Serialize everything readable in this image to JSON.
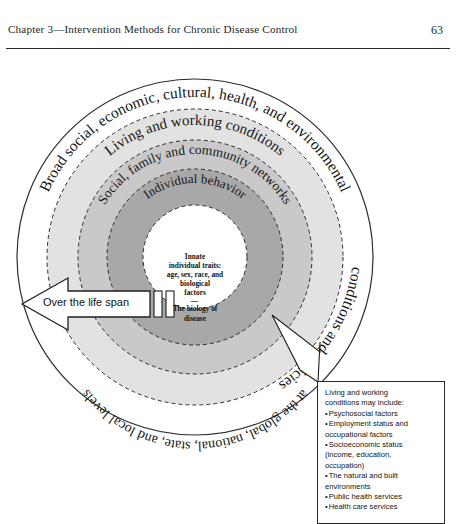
{
  "header": {
    "title": "Chapter 3—Intervention Methods for Chronic Disease Control",
    "page_number": "63"
  },
  "figure": {
    "rings": [
      {
        "id": "outer",
        "label_top": "Broad social, economic, cultural, health, and environmental",
        "label_right": "conditions and policies",
        "label_bottom": "at the global, national, state, and local levels",
        "fill": "#ffffff"
      },
      {
        "id": "living-working",
        "label": "Living and working conditions",
        "fill": "#e2e2e2"
      },
      {
        "id": "social-family",
        "label": "Social, family and community networks",
        "fill": "#c9c9c9"
      },
      {
        "id": "individual-behavior",
        "label": "Individual behavior",
        "fill": "#a8a8a8"
      },
      {
        "id": "core",
        "fill": "#ffffff"
      }
    ],
    "core": {
      "line1": "Innate",
      "line2": "individual traits:",
      "line3": "age, sex, race, and",
      "line4": "biological",
      "line5": "factors",
      "separator": "—",
      "line6": "The biology of",
      "line7": "disease"
    },
    "lifespan_arrow": {
      "label": "Over the life span"
    },
    "callout": {
      "lines": [
        {
          "text": "Living and working",
          "bullet": false
        },
        {
          "text": "conditions may include:",
          "bullet": false
        },
        {
          "text": "Psychosocial factors",
          "bullet": true
        },
        {
          "text": "Employment status and",
          "bullet": true
        },
        {
          "text": "occupational factors",
          "bullet": false
        },
        {
          "text": "Socioeconomic status",
          "bullet": true
        },
        {
          "text": "(income, education,",
          "bullet": false
        },
        {
          "text": "occupation)",
          "bullet": false
        },
        {
          "text": "The natural and built",
          "bullet": true
        },
        {
          "text": "environments",
          "bullet": false
        },
        {
          "text": "Public health services",
          "bullet": true
        },
        {
          "text": "Health care services",
          "bullet": true
        }
      ]
    }
  }
}
